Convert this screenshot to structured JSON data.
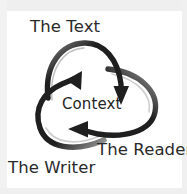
{
  "figure": {
    "kind": "cyclic-triangle-diagram",
    "title_visible": false,
    "background_color": "#ffffff",
    "ink_color": "#1f1f1f",
    "paper_border_color": "#efefef"
  },
  "labels": {
    "top": "The Text",
    "center": "Context",
    "bottom_right": "The Reader",
    "bottom_left": "The Writer"
  },
  "arrows": [
    {
      "id": "arrow-text-to-reader",
      "from": "The Text",
      "to": "The Reader",
      "direction": "clockwise",
      "head_position": "lower-right",
      "head_points": "down"
    },
    {
      "id": "arrow-reader-to-writer",
      "from": "The Reader",
      "to": "The Writer",
      "direction": "clockwise",
      "head_position": "bottom-center-left",
      "head_points": "left"
    },
    {
      "id": "arrow-writer-to-text",
      "from": "The Writer",
      "to": "The Text",
      "direction": "clockwise",
      "head_position": "upper-left-center",
      "head_points": "up-right"
    }
  ],
  "icons": {
    "arrowhead": "triangle-arrowhead-icon"
  }
}
